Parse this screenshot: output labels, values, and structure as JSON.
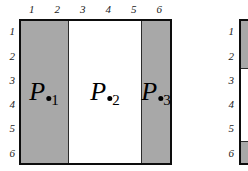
{
  "diagram": {
    "grid": {
      "columns": 6,
      "rows": 6,
      "column_labels": [
        "1",
        "2",
        "3",
        "4",
        "5",
        "6"
      ],
      "row_labels": [
        "1",
        "2",
        "3",
        "4",
        "5",
        "6"
      ]
    },
    "colors": {
      "shaded": "#a8a8a8",
      "unshaded": "#ffffff",
      "border": "#0d0d0d",
      "label": "#1a1a1a",
      "marker": "#000000"
    },
    "regions": [
      {
        "name": "region-p1",
        "label": "P",
        "subscript": "1",
        "marker": "filled-dot",
        "fill": "shaded",
        "column_span": "1-2"
      },
      {
        "name": "region-p2",
        "label": "P",
        "subscript": "2",
        "marker": "filled-dot",
        "fill": "unshaded",
        "column_span": "3-5"
      },
      {
        "name": "region-p3",
        "label": "P",
        "subscript": "3",
        "marker": "filled-dot",
        "fill": "shaded",
        "column_span": "6"
      }
    ]
  },
  "partial_figure": {
    "name": "adjacent-figure-clipped",
    "row_labels": [
      "1",
      "2",
      "3",
      "4",
      "5",
      "6"
    ],
    "segments": [
      {
        "fill": "shaded",
        "row_span": "1-2"
      },
      {
        "fill": "unshaded",
        "row_span": "3-5"
      },
      {
        "fill": "shaded",
        "row_span": "6"
      }
    ]
  }
}
